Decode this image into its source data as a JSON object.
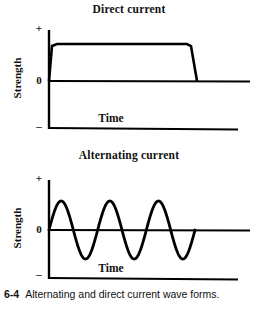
{
  "figure": {
    "caption_number": "6-4",
    "caption_text": "Alternating and direct current wave forms.",
    "background_color": "#ffffff",
    "ink_color": "#000000"
  },
  "charts": [
    {
      "id": "direct-current",
      "title": "Direct current",
      "ylabel": "Strength",
      "xlabel": "Time",
      "ytick_labels": {
        "positive": "+",
        "zero": "0",
        "negative": "–"
      }
    },
    {
      "id": "alternating-current",
      "title": "Alternating current",
      "ylabel": "Strength",
      "xlabel": "Time",
      "ytick_labels": {
        "positive": "+",
        "zero": "0",
        "negative": "–"
      }
    }
  ],
  "chart_data": [
    {
      "type": "line",
      "id": "direct-current",
      "title": "Direct current",
      "xlabel": "Time",
      "ylabel": "Strength",
      "xlim": [
        0,
        100
      ],
      "ylim": [
        -1,
        1
      ],
      "ytick_values": [
        1,
        0,
        -1
      ],
      "ytick_labels": [
        "+",
        "0",
        "–"
      ],
      "xticks": [],
      "grid": false,
      "legend": false,
      "series": [
        {
          "name": "Direct current",
          "description": "Constant positive current: rapid rise from zero, steady plateau, then rapid fall back to zero",
          "x": [
            0,
            4,
            70,
            75,
            100
          ],
          "y": [
            0,
            0.62,
            0.62,
            0,
            0
          ]
        }
      ]
    },
    {
      "type": "line",
      "id": "alternating-current",
      "title": "Alternating current",
      "xlabel": "Time",
      "ylabel": "Strength",
      "xlim": [
        0,
        100
      ],
      "ylim": [
        -1,
        1
      ],
      "ytick_values": [
        1,
        0,
        -1
      ],
      "ytick_labels": [
        "+",
        "0",
        "–"
      ],
      "xticks": [],
      "grid": false,
      "legend": false,
      "series": [
        {
          "name": "Alternating current",
          "description": "Sinusoidal current alternating between positive and negative, three complete cycles",
          "waveform": "sine",
          "amplitude": 0.62,
          "cycles": 3,
          "start_x": 0,
          "end_x": 75,
          "phase_deg": 0
        }
      ]
    }
  ]
}
